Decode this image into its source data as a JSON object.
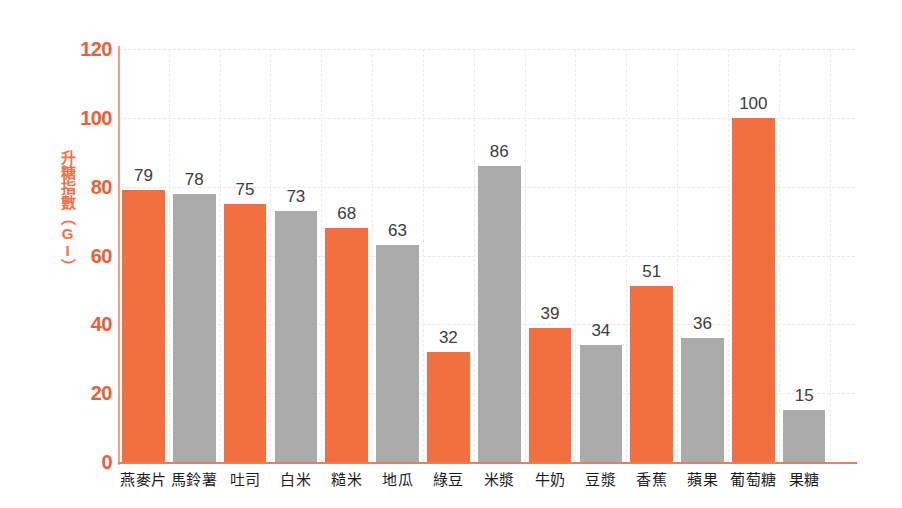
{
  "chart_data": {
    "type": "bar",
    "title": "",
    "subtitle": "",
    "xlabel": "",
    "ylabel": "升糖指數（GI）",
    "ylim": [
      0,
      120
    ],
    "ytick_values": [
      0,
      20,
      40,
      60,
      80,
      100,
      120
    ],
    "ytick_labels": [
      "0",
      "20",
      "40",
      "60",
      "80",
      "100",
      "120"
    ],
    "grid": true,
    "legend": "none",
    "categories": [
      "燕麥片",
      "馬鈴薯",
      "吐司",
      "白米",
      "糙米",
      "地瓜",
      "綠豆",
      "米漿",
      "牛奶",
      "豆漿",
      "香蕉",
      "蘋果",
      "葡萄糖",
      "果糖"
    ],
    "values": [
      79,
      78,
      75,
      73,
      68,
      63,
      32,
      86,
      39,
      34,
      51,
      36,
      100,
      15
    ],
    "value_labels": [
      "79",
      "78",
      "75",
      "73",
      "68",
      "63",
      "32",
      "86",
      "39",
      "34",
      "51",
      "36",
      "100",
      "15"
    ],
    "bar_colors": [
      "#F2703F",
      "#ABABAB",
      "#F2703F",
      "#ABABAB",
      "#F2703F",
      "#ABABAB",
      "#F2703F",
      "#ABABAB",
      "#F2703F",
      "#ABABAB",
      "#F2703F",
      "#ABABAB",
      "#F2703F",
      "#ABABAB"
    ],
    "series": [
      {
        "name": "升糖指數",
        "values": [
          79,
          78,
          75,
          73,
          68,
          63,
          32,
          86,
          39,
          34,
          51,
          36,
          100,
          15
        ]
      }
    ]
  },
  "colors": {
    "orange": "#F2703F",
    "gray": "#ABABAB",
    "axis": "#EE7E55",
    "axis_y": "#F0A183",
    "tick_text": "#E8603A",
    "value_text": "#3D3D3D",
    "category_text": "#1D1D1D",
    "grid": "#EFE7E4",
    "background": "#FEFEFE"
  }
}
